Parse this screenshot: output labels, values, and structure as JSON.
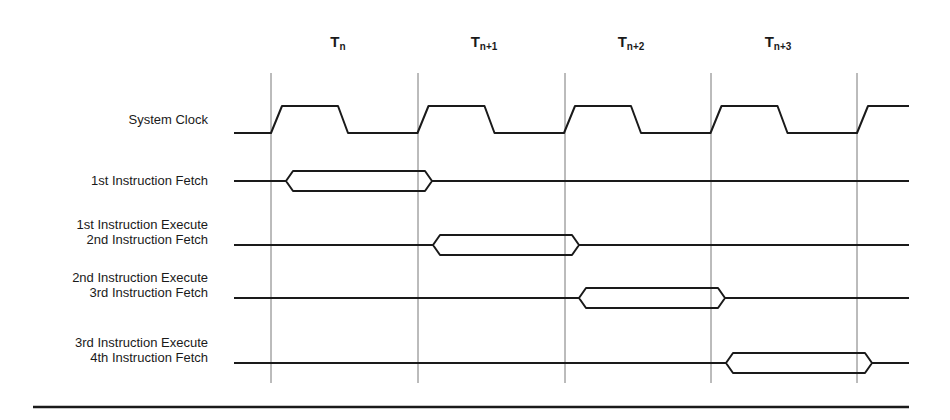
{
  "diagram": {
    "type": "timing-diagram",
    "period_labels": [
      {
        "base": "T",
        "sub": "n",
        "x": 338
      },
      {
        "base": "T",
        "sub": "n+1",
        "x": 484
      },
      {
        "base": "T",
        "sub": "n+2",
        "x": 631
      },
      {
        "base": "T",
        "sub": "n+3",
        "x": 778
      }
    ],
    "signals": [
      {
        "id": "clock",
        "lines": [
          "System Clock"
        ],
        "y": 120
      },
      {
        "id": "fetch1",
        "lines": [
          "1st Instruction Fetch"
        ],
        "y": 181
      },
      {
        "id": "exec1",
        "lines": [
          "1st Instruction Execute",
          "2nd Instruction Fetch"
        ],
        "y": 245
      },
      {
        "id": "exec2",
        "lines": [
          "2nd Instruction Execute",
          "3rd Instruction Fetch"
        ],
        "y": 298
      },
      {
        "id": "exec3",
        "lines": [
          "3rd Instruction Execute",
          "4th Instruction Fetch"
        ],
        "y": 363
      }
    ],
    "gridlines_x": [
      271,
      418,
      565,
      711,
      857
    ],
    "bus_windows": [
      {
        "row": "fetch1",
        "start": 286,
        "end": 432
      },
      {
        "row": "exec1",
        "start": 433,
        "end": 579
      },
      {
        "row": "exec2",
        "start": 579,
        "end": 725
      },
      {
        "row": "exec3",
        "start": 726,
        "end": 872
      }
    ],
    "colors": {
      "line": "#1a1a1a",
      "grid": "#555555"
    }
  }
}
